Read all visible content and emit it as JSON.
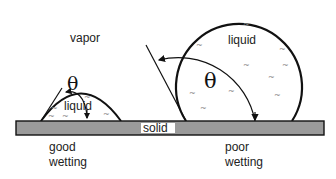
{
  "diagram": {
    "labels": {
      "vapor": "vapor",
      "solid": "solid",
      "left_liquid": "liquid",
      "right_liquid": "liquid",
      "left_caption_line1": "good",
      "left_caption_line2": "wetting",
      "right_caption_line1": "poor",
      "right_caption_line2": "wetting",
      "left_angle": "θ",
      "right_angle": "θ"
    },
    "colors": {
      "solid_fill": "#9a9a9a",
      "outline": "#111111",
      "background": "#ffffff",
      "ripple": "#888888"
    },
    "ripple_glyph": "~"
  }
}
